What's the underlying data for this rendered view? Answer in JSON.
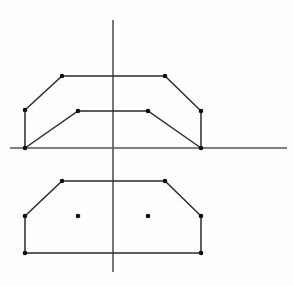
{
  "figure": {
    "title": "",
    "background_color": "#fefefe",
    "width": 293,
    "height": 286
  },
  "colors": {
    "axis": "#55565a",
    "profile": "#2b2b2e",
    "vertex": "#101012",
    "background": "#fefefe"
  },
  "chart_data": {
    "type": "line",
    "title": "",
    "subtitle": "",
    "xlabel": "",
    "ylabel": "",
    "xlim": [
      0,
      293
    ],
    "ylim": [
      286,
      0
    ],
    "grid": false,
    "legend": null,
    "tick_labels_x": [],
    "tick_labels_y": [],
    "annotations": [],
    "axes": {
      "origin": {
        "x": 113,
        "y": 148
      },
      "horizontal": {
        "x1": 10,
        "y1": 148,
        "x2": 287,
        "y2": 148
      },
      "vertical": {
        "x1": 113,
        "y1": 20,
        "x2": 113,
        "y2": 272
      }
    },
    "series": [
      {
        "name": "upper-outer-profile",
        "closed": false,
        "points": [
          {
            "x": 25,
            "y": 148
          },
          {
            "x": 25,
            "y": 110
          },
          {
            "x": 62,
            "y": 76
          },
          {
            "x": 165,
            "y": 76
          },
          {
            "x": 201,
            "y": 111
          },
          {
            "x": 201,
            "y": 148
          }
        ]
      },
      {
        "name": "upper-inner-profile",
        "closed": false,
        "points": [
          {
            "x": 25,
            "y": 148
          },
          {
            "x": 78,
            "y": 111
          },
          {
            "x": 148,
            "y": 111
          },
          {
            "x": 201,
            "y": 148
          }
        ]
      },
      {
        "name": "lower-outer-profile",
        "closed": false,
        "points": [
          {
            "x": 25,
            "y": 216
          },
          {
            "x": 62,
            "y": 181
          },
          {
            "x": 165,
            "y": 181
          },
          {
            "x": 201,
            "y": 216
          }
        ]
      },
      {
        "name": "lower-inner-profile",
        "closed": false,
        "points": [
          {
            "x": 25,
            "y": 216
          },
          {
            "x": 25,
            "y": 253
          },
          {
            "x": 78,
            "y": 253
          },
          {
            "x": 148,
            "y": 253
          },
          {
            "x": 201,
            "y": 253
          },
          {
            "x": 201,
            "y": 216
          }
        ]
      }
    ],
    "vertices": [
      {
        "x": 25,
        "y": 148
      },
      {
        "x": 25,
        "y": 110
      },
      {
        "x": 62,
        "y": 76
      },
      {
        "x": 165,
        "y": 76
      },
      {
        "x": 201,
        "y": 111
      },
      {
        "x": 201,
        "y": 148
      },
      {
        "x": 78,
        "y": 111
      },
      {
        "x": 148,
        "y": 111
      },
      {
        "x": 25,
        "y": 216
      },
      {
        "x": 62,
        "y": 181
      },
      {
        "x": 165,
        "y": 181
      },
      {
        "x": 201,
        "y": 216
      },
      {
        "x": 25,
        "y": 253
      },
      {
        "x": 78,
        "y": 216
      },
      {
        "x": 148,
        "y": 216
      },
      {
        "x": 201,
        "y": 253
      }
    ]
  }
}
